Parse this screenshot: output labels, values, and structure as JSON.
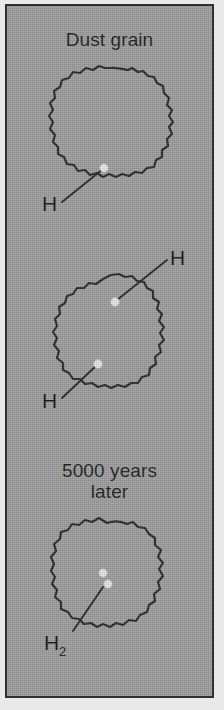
{
  "figure": {
    "background_color": "#9b9b9b",
    "ink_color": "#262626",
    "frame_color": "#2f2f2f",
    "atom_dot_color": "#e3e3e3",
    "paper_color": "#e9e9e9"
  },
  "panels": [
    {
      "id": "panel-1",
      "caption": "Dust grain",
      "caption_lines": [
        "Dust grain"
      ],
      "atoms": [
        {
          "label": "H",
          "label_position": "lower-left"
        }
      ],
      "atom_count": 1
    },
    {
      "id": "panel-2",
      "caption": "",
      "caption_lines": [],
      "atoms": [
        {
          "label": "H",
          "label_position": "upper-right"
        },
        {
          "label": "H",
          "label_position": "lower-left"
        }
      ],
      "atom_count": 2
    },
    {
      "id": "panel-3",
      "caption": "5000 years later",
      "caption_lines": [
        "5000 years",
        "later"
      ],
      "atoms": [
        {
          "label": "H2",
          "label_base": "H",
          "label_subscript": "2",
          "label_position": "lower-left"
        }
      ],
      "atom_count": 2
    }
  ],
  "labels": {
    "panel1_h": "H",
    "panel2_h_top": "H",
    "panel2_h_bottom": "H",
    "panel3_h2_base": "H",
    "panel3_h2_sub": "2",
    "caption1": "Dust grain",
    "caption3_line1": "5000 years",
    "caption3_line2": "later"
  }
}
